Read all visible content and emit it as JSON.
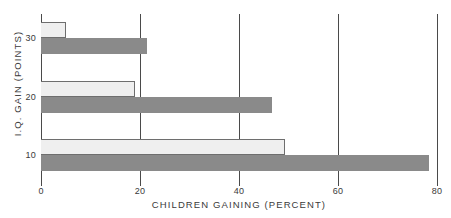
{
  "chart_data": {
    "type": "bar",
    "orientation": "horizontal",
    "title": "",
    "subtitle": "",
    "xlabel": "CHILDREN GAINING (PERCENT)",
    "ylabel": "I.Q. GAIN (POINTS)",
    "xlim": [
      0,
      80
    ],
    "ylim": [
      5,
      35
    ],
    "xticks": [
      0,
      20,
      40,
      60,
      80
    ],
    "xtick_labels": [
      "0",
      "20",
      "40",
      "60",
      "80"
    ],
    "yticks": [
      10,
      20,
      30
    ],
    "ytick_labels": [
      "10",
      "20",
      "30"
    ],
    "grid": "vertical gridlines at every x tick",
    "legend": "none",
    "categories": [
      "30",
      "20",
      "10"
    ],
    "series": [
      {
        "name": "light",
        "color": "#efefef",
        "values": [
          5.0,
          19.0,
          49.3
        ]
      },
      {
        "name": "dark",
        "color": "#8a8a8a",
        "values": [
          21.4,
          46.7,
          78.4
        ]
      }
    ],
    "bars": [
      {
        "group": "30",
        "series": "light",
        "value": 5.0
      },
      {
        "group": "30",
        "series": "dark",
        "value": 21.4
      },
      {
        "group": "20",
        "series": "light",
        "value": 19.0
      },
      {
        "group": "20",
        "series": "dark",
        "value": 46.7
      },
      {
        "group": "10",
        "series": "light",
        "value": 49.3
      },
      {
        "group": "10",
        "series": "dark",
        "value": 78.4
      }
    ]
  },
  "colors": {
    "background": "#ffffff",
    "axis": "#4a4a4a",
    "text": "#3a3a3a",
    "light_bar": "#efefef",
    "light_bar_outline": "#6e6e6e",
    "dark_bar": "#8a8a8a"
  },
  "axes": {
    "x": {
      "title": "CHILDREN GAINING (PERCENT)",
      "ticks": [
        {
          "label": "0",
          "value": 0
        },
        {
          "label": "20",
          "value": 20
        },
        {
          "label": "40",
          "value": 40
        },
        {
          "label": "60",
          "value": 60
        },
        {
          "label": "80",
          "value": 80
        }
      ]
    },
    "y": {
      "title": "I.Q. GAIN (POINTS)",
      "ticks": [
        {
          "label": "30",
          "value": 30
        },
        {
          "label": "20",
          "value": 20
        },
        {
          "label": "10",
          "value": 10
        }
      ]
    }
  }
}
